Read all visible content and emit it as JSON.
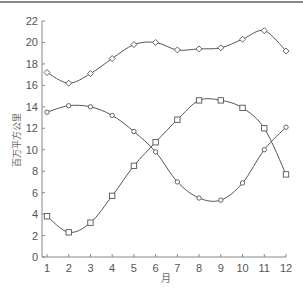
{
  "chart_data": {
    "type": "line",
    "title": "",
    "xlabel": "月",
    "ylabel": "百万平方公里",
    "x": [
      1,
      2,
      3,
      4,
      5,
      6,
      7,
      8,
      9,
      10,
      11,
      12
    ],
    "xlim": [
      1,
      12
    ],
    "ylim": [
      0,
      22
    ],
    "yticks": [
      0,
      2,
      4,
      6,
      8,
      10,
      12,
      14,
      16,
      18,
      20,
      22
    ],
    "xticks": [
      1,
      2,
      3,
      4,
      5,
      6,
      7,
      8,
      9,
      10,
      11,
      12
    ],
    "grid": false,
    "legend": null,
    "series": [
      {
        "name": "diamond-series",
        "marker": "diamond",
        "values": [
          17.2,
          16.2,
          17.1,
          18.5,
          19.8,
          20.0,
          19.3,
          19.4,
          19.5,
          20.3,
          21.1,
          19.2
        ]
      },
      {
        "name": "circle-series",
        "marker": "circle",
        "values": [
          13.5,
          14.1,
          14.0,
          13.2,
          11.7,
          9.8,
          7.0,
          5.5,
          5.3,
          6.9,
          10.0,
          12.1
        ]
      },
      {
        "name": "square-series",
        "marker": "square",
        "values": [
          3.8,
          2.3,
          3.2,
          5.7,
          8.5,
          10.7,
          12.8,
          14.6,
          14.6,
          13.9,
          12.0,
          7.7
        ]
      }
    ]
  },
  "colors": {
    "line": "#555555",
    "marker": "#555555",
    "axis": "#888888",
    "text": "#555555"
  }
}
